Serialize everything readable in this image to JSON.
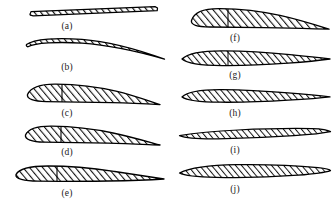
{
  "figure": {
    "background_color": "#ffffff",
    "outline_color": "#000000",
    "hatch_color": "#1a1a1a",
    "columns": 2,
    "rows": 5,
    "total_profiles": 10
  },
  "profiles": [
    {
      "id": "a",
      "label": "(a)",
      "name": "flat-plate-section",
      "description": "Thin flat plate, slightly inclined, uniform thickness",
      "column": "left",
      "row": 1,
      "chord_px": 130,
      "max_thickness_px": 4,
      "camber": "none",
      "leading_edge": "blunt-thin",
      "trailing_edge": "blunt-thin",
      "has_chord_marker": false
    },
    {
      "id": "b",
      "label": "(b)",
      "name": "curved-plate-section",
      "description": "Thin circular-arc cambered plate with drooping trailing edge",
      "column": "left",
      "row": 2,
      "chord_px": 140,
      "max_thickness_px": 6,
      "camber": "high",
      "leading_edge": "rounded-thin",
      "trailing_edge": "sharp",
      "has_chord_marker": false
    },
    {
      "id": "c",
      "label": "(c)",
      "name": "thick-cambered-section",
      "description": "Thick cambered airfoil, blunt rounded leading edge, sharp trailing edge",
      "column": "left",
      "row": 3,
      "chord_px": 140,
      "max_thickness_px": 25,
      "camber": "high",
      "leading_edge": "blunt-round",
      "trailing_edge": "sharp",
      "has_chord_marker": true,
      "chord_marker_pct": 26
    },
    {
      "id": "d",
      "label": "(d)",
      "name": "medium-thick-cambered-section",
      "description": "Moderately thick cambered airfoil with rounded nose",
      "column": "left",
      "row": 4,
      "chord_px": 140,
      "max_thickness_px": 21,
      "camber": "medium",
      "leading_edge": "round",
      "trailing_edge": "sharp",
      "has_chord_marker": true,
      "chord_marker_pct": 30
    },
    {
      "id": "e",
      "label": "(e)",
      "name": "slender-cambered-section",
      "description": "Slender low-camber airfoil with long tapered tail",
      "column": "left",
      "row": 5,
      "chord_px": 148,
      "max_thickness_px": 16,
      "camber": "low",
      "leading_edge": "round",
      "trailing_edge": "sharp",
      "has_chord_marker": true,
      "chord_marker_pct": 30
    },
    {
      "id": "f",
      "label": "(f)",
      "name": "thick-subsonic-section",
      "description": "Thick subsonic airfoil, rounded leading edge, reflexed tail",
      "column": "right",
      "row": 1,
      "chord_px": 140,
      "max_thickness_px": 24,
      "camber": "medium",
      "leading_edge": "blunt-round",
      "trailing_edge": "sharp",
      "has_chord_marker": true,
      "chord_marker_pct": 30
    },
    {
      "id": "g",
      "label": "(g)",
      "name": "thin-lenticular-section",
      "description": "Thin nearly symmetric section with sharp extended trailing edge",
      "column": "right",
      "row": 2,
      "chord_px": 142,
      "max_thickness_px": 14,
      "camber": "low",
      "leading_edge": "sharp-round",
      "trailing_edge": "sharp",
      "has_chord_marker": true,
      "chord_marker_pct": 33
    },
    {
      "id": "h",
      "label": "(h)",
      "name": "thin-tapered-section",
      "description": "Thin tapered section with long straight trailing wedge",
      "column": "right",
      "row": 3,
      "chord_px": 142,
      "max_thickness_px": 12,
      "camber": "low",
      "leading_edge": "sharp-round",
      "trailing_edge": "sharp",
      "has_chord_marker": false
    },
    {
      "id": "i",
      "label": "(i)",
      "name": "double-wedge-section",
      "description": "Very thin supersonic double-wedge with sharp leading and trailing edges",
      "column": "right",
      "row": 4,
      "chord_px": 148,
      "max_thickness_px": 9,
      "camber": "none",
      "leading_edge": "sharp",
      "trailing_edge": "sharp",
      "has_chord_marker": false
    },
    {
      "id": "j",
      "label": "(j)",
      "name": "biconvex-lens-section",
      "description": "Thin symmetric biconvex lens section with sharp points both ends",
      "column": "right",
      "row": 5,
      "chord_px": 148,
      "max_thickness_px": 10,
      "camber": "none",
      "leading_edge": "sharp",
      "trailing_edge": "sharp",
      "has_chord_marker": false
    }
  ]
}
